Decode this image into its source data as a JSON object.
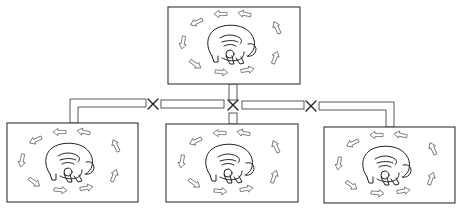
{
  "diagram": {
    "type": "tree",
    "description": "A parent panel containing a curled animal figure surrounded by a circulating ring of arrows, connected by pipes to three identical child panels; each pipe junction is marked with an X.",
    "colors": {
      "line": "#333333",
      "background": "#ffffff"
    },
    "nodes": [
      {
        "id": "top",
        "role": "parent",
        "icon": "mammoth-icon",
        "ring": "circular-arrows-icon"
      },
      {
        "id": "bottom-left",
        "role": "child",
        "icon": "mammoth-icon",
        "ring": "circular-arrows-icon"
      },
      {
        "id": "bottom-center",
        "role": "child",
        "icon": "mammoth-icon",
        "ring": "circular-arrows-icon"
      },
      {
        "id": "bottom-right",
        "role": "child",
        "icon": "mammoth-icon",
        "ring": "circular-arrows-icon"
      }
    ],
    "connectors": [
      {
        "from": "top",
        "to": "bottom-left",
        "marker": "x"
      },
      {
        "from": "top",
        "to": "bottom-center",
        "marker": "x"
      },
      {
        "from": "top",
        "to": "bottom-right",
        "marker": "x"
      }
    ],
    "markers": [
      {
        "symbol": "×",
        "position": "left-junction"
      },
      {
        "symbol": "×",
        "position": "center-junction"
      },
      {
        "symbol": "×",
        "position": "right-junction"
      }
    ]
  }
}
